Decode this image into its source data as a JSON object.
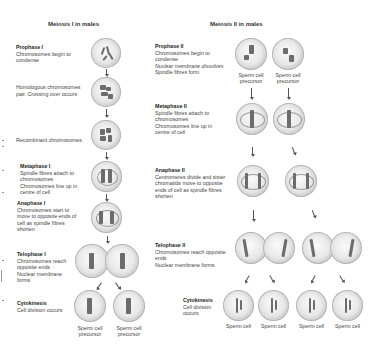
{
  "meiosis1": {
    "title": "Meiosis I in males",
    "stages": [
      {
        "heading": "Prophase I",
        "lines": [
          "Chromosomes begin to",
          "condense"
        ]
      },
      {
        "heading": "",
        "lines": [
          "Homologous chromosomes",
          "pair. Crossing over occurs"
        ]
      },
      {
        "heading": "",
        "lines": [
          "Recombinant chromosomes"
        ]
      },
      {
        "heading": "Metaphase I",
        "lines": [
          "Spindle fibres attach to",
          "chromosomes",
          "Chromosomes line up in",
          "centre of cell"
        ]
      },
      {
        "heading": "Anaphase I",
        "lines": [
          "Chromosomes start to",
          "move to opposite ends of",
          "cell as spindle fibres",
          "shorten"
        ]
      },
      {
        "heading": "Telophase I",
        "lines": [
          "Chromosomes reach",
          "opposite ends",
          "Nuclear membrane",
          "forms"
        ]
      },
      {
        "heading": "Cytokinesis",
        "lines": [
          "Cell division occurs"
        ]
      }
    ],
    "captions": [
      {
        "line1": "Sperm cell",
        "line2": "precursor"
      },
      {
        "line1": "Sperm cell",
        "line2": "precursor"
      }
    ]
  },
  "meiosis2": {
    "title": "Meiosis II in males",
    "stages": [
      {
        "heading": "Prophase II",
        "lines": [
          "Chromosomes begin to",
          "condense",
          "Nuclear membrane dissolves",
          "Spindle fibres form"
        ]
      },
      {
        "heading": "Metaphase II",
        "lines": [
          "Spindle fibres attach to",
          "chromosomes",
          "Chromosomes line up in",
          "centre of cell"
        ]
      },
      {
        "heading": "Anaphase II",
        "lines": [
          "Centromeres divide and sister",
          "chromatids move to opposite",
          "ends of cell as spindle fibres",
          "shorten"
        ]
      },
      {
        "heading": "Telophase II",
        "lines": [
          "Chromosomes reach opposite",
          "ends",
          "Nuclear membrane forms"
        ]
      },
      {
        "heading": "Cytokinesis",
        "lines": [
          "Cell division",
          "occurs"
        ]
      }
    ],
    "precursor_captions": [
      {
        "line1": "Sperm cell",
        "line2": "precursor"
      },
      {
        "line1": "Sperm cell",
        "line2": "precursor"
      }
    ],
    "sperm_captions": [
      "Sperm cell",
      "Sperm cell",
      "Sperm cell",
      "Sperm cell"
    ]
  }
}
